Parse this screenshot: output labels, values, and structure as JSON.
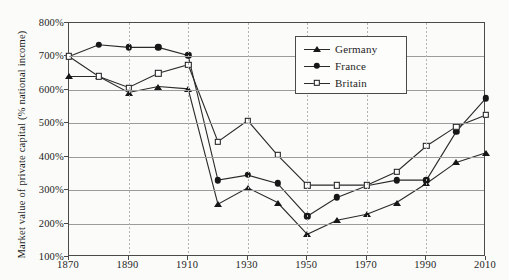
{
  "chart_data": {
    "type": "line",
    "title": "",
    "xlabel": "",
    "ylabel": "Market value of private capital (% national income)",
    "xlim": [
      1870,
      2010
    ],
    "ylim": [
      100,
      800
    ],
    "grid": true,
    "legend_position": "top-center-right",
    "y_ticks": [
      "100%",
      "200%",
      "300%",
      "400%",
      "500%",
      "600%",
      "700%",
      "800%"
    ],
    "y_tick_values": [
      100,
      200,
      300,
      400,
      500,
      600,
      700,
      800
    ],
    "x_ticks": [
      "1870",
      "1890",
      "1910",
      "1930",
      "1950",
      "1970",
      "1990",
      "2010"
    ],
    "x_tick_values": [
      1870,
      1890,
      1910,
      1930,
      1950,
      1970,
      1990,
      2010
    ],
    "x": [
      1870,
      1880,
      1890,
      1900,
      1910,
      1920,
      1930,
      1940,
      1950,
      1960,
      1970,
      1980,
      1990,
      2000,
      2010
    ],
    "series": [
      {
        "name": "Germany",
        "marker": "triangle-filled",
        "color": "#171717",
        "values": [
          640,
          640,
          592,
          610,
          603,
          258,
          307,
          263,
          168,
          210,
          228,
          263,
          320,
          383,
          412
        ]
      },
      {
        "name": "France",
        "marker": "circle-filled",
        "color": "#171717",
        "values": [
          700,
          735,
          727,
          727,
          703,
          330,
          345,
          320,
          222,
          278,
          313,
          330,
          330,
          475,
          575
        ]
      },
      {
        "name": "Britain",
        "marker": "square-open",
        "color": "#171717",
        "values": [
          700,
          640,
          607,
          650,
          675,
          445,
          508,
          405,
          315,
          315,
          315,
          355,
          432,
          490,
          525
        ]
      }
    ]
  },
  "axis": {
    "y_title": "Market value of private capital (% national income)"
  },
  "legend": {
    "items": [
      {
        "label": "Germany"
      },
      {
        "label": "France"
      },
      {
        "label": "Britain"
      }
    ]
  },
  "colors": {
    "ink": "#1d1d1d",
    "line": "#2a2a2a",
    "grid": "#9b9b9b",
    "grid_dotted": "#b3b3b3",
    "frame": "#4a4a4a",
    "background": "#fbfbf9"
  }
}
